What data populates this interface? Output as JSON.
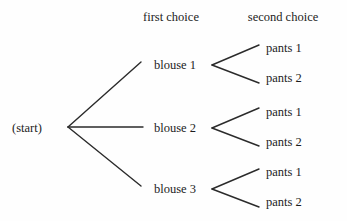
{
  "diagram": {
    "type": "probability-tree",
    "background_color": "#fefefe",
    "line_color": "#2b2b2b",
    "text_color": "#1c1c1c",
    "headers": [
      {
        "label": "first choice",
        "x": 171,
        "y": 17
      },
      {
        "label": "second choice",
        "x": 283,
        "y": 17
      }
    ],
    "root": {
      "label": "(start)",
      "x": 12,
      "y": 128
    },
    "level1": [
      {
        "label": "blouse 1",
        "x": 175,
        "y": 65
      },
      {
        "label": "blouse 2",
        "x": 175,
        "y": 128
      },
      {
        "label": "blouse 3",
        "x": 175,
        "y": 189
      }
    ],
    "level2": [
      {
        "label": "pants 1",
        "x": 266,
        "y": 48
      },
      {
        "label": "pants 2",
        "x": 266,
        "y": 78
      },
      {
        "label": "pants 1",
        "x": 266,
        "y": 112
      },
      {
        "label": "pants 2",
        "x": 266,
        "y": 142
      },
      {
        "label": "pants 1",
        "x": 266,
        "y": 172
      },
      {
        "label": "pants 2",
        "x": 266,
        "y": 202
      }
    ],
    "edges_level1": [
      {
        "x1": 68,
        "y1": 127,
        "x2": 141,
        "y2": 62
      },
      {
        "x1": 68,
        "y1": 127,
        "x2": 143,
        "y2": 127
      },
      {
        "x1": 68,
        "y1": 127,
        "x2": 141,
        "y2": 186
      }
    ],
    "edges_level2": [
      {
        "x1": 212,
        "y1": 65,
        "x2": 259,
        "y2": 45
      },
      {
        "x1": 212,
        "y1": 65,
        "x2": 259,
        "y2": 83
      },
      {
        "x1": 212,
        "y1": 128,
        "x2": 259,
        "y2": 108
      },
      {
        "x1": 212,
        "y1": 128,
        "x2": 259,
        "y2": 146
      },
      {
        "x1": 212,
        "y1": 189,
        "x2": 259,
        "y2": 169
      },
      {
        "x1": 212,
        "y1": 189,
        "x2": 259,
        "y2": 207
      }
    ]
  }
}
